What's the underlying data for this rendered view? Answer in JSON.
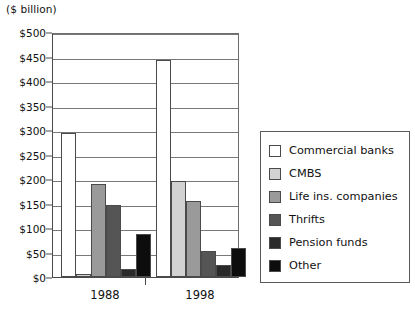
{
  "chart_data": {
    "type": "bar",
    "title": "($ billion)",
    "xlabel": "",
    "ylabel": "($ billion)",
    "categories": [
      "1988",
      "1998"
    ],
    "series": [
      {
        "name": "Commercial banks",
        "values": [
          293,
          443
        ],
        "color": "#ffffff"
      },
      {
        "name": "CMBS",
        "values": [
          7,
          195
        ],
        "color": "#d2d2d2"
      },
      {
        "name": "Life ins. companies",
        "values": [
          190,
          155
        ],
        "color": "#9a9a9a"
      },
      {
        "name": "Thrifts",
        "values": [
          147,
          53
        ],
        "color": "#555555"
      },
      {
        "name": "Pension funds",
        "values": [
          17,
          25
        ],
        "color": "#2a2a2a"
      },
      {
        "name": "Other",
        "values": [
          88,
          60
        ],
        "color": "#0d0d0d"
      }
    ],
    "ylim": [
      0,
      500
    ],
    "yticks": [
      "$0",
      "$50",
      "$100",
      "$150",
      "$200",
      "$250",
      "$300",
      "$350",
      "$400",
      "$450",
      "$500"
    ],
    "ytick_values": [
      0,
      50,
      100,
      150,
      200,
      250,
      300,
      350,
      400,
      450,
      500
    ],
    "grid": true,
    "legend_position": "right"
  },
  "legend": {
    "items": [
      {
        "label": "Commercial banks"
      },
      {
        "label": "CMBS"
      },
      {
        "label": "Life ins. companies"
      },
      {
        "label": "Thrifts"
      },
      {
        "label": "Pension funds"
      },
      {
        "label": "Other"
      }
    ]
  }
}
